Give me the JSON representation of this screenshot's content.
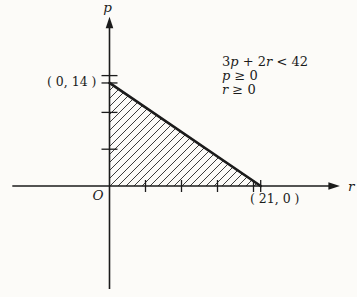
{
  "figure": {
    "background": "#fcfbf8",
    "ink": "#1b1b1b",
    "axis": {
      "x_label": "r",
      "y_label": "p",
      "origin_label": "O"
    },
    "labels": {
      "y_intercept": "( 0, 14 )",
      "x_intercept": "( 21, 0 )"
    },
    "annotation": {
      "line1": [
        "3",
        "p",
        " + 2",
        "r",
        " < 42"
      ],
      "line2": [
        "p",
        " ≥ 0"
      ],
      "line3": [
        "r",
        " ≥ 0"
      ]
    }
  },
  "chart_data": {
    "type": "area",
    "title": "",
    "xlabel": "r",
    "ylabel": "p",
    "inequalities": [
      "3p + 2r < 42",
      "p ≥ 0",
      "r ≥ 0"
    ],
    "boundary_line": {
      "equation": "3p + 2r = 42",
      "points": [
        [
          0,
          14
        ],
        [
          21,
          0
        ]
      ]
    },
    "region_vertices": [
      [
        0,
        0
      ],
      [
        0,
        14
      ],
      [
        21,
        0
      ]
    ],
    "x_intercept": [
      21,
      0
    ],
    "y_intercept": [
      0,
      14
    ],
    "x_ticks": [
      5,
      10,
      15,
      20
    ],
    "y_ticks": [
      5,
      10,
      15
    ],
    "xlim": [
      -13.5,
      32
    ],
    "ylim": [
      -14,
      23
    ],
    "grid": false,
    "legend": false,
    "fill_style": "diagonal-hatch"
  }
}
